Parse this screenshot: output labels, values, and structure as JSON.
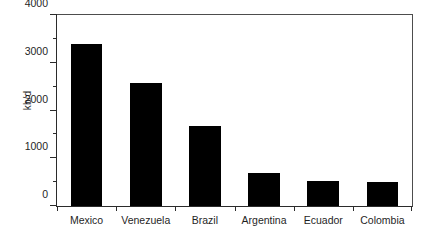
{
  "chart_data": {
    "type": "bar",
    "title": "",
    "subtitle": "",
    "xlabel": "",
    "ylabel": "kb/d",
    "categories": [
      "Mexico",
      "Venezuela",
      "Brazil",
      "Argentina",
      "Ecuador",
      "Colombia"
    ],
    "values": [
      3400,
      2580,
      1670,
      690,
      530,
      510
    ],
    "ylim": [
      0,
      4000
    ],
    "ytick_labels": [
      "0",
      "1000",
      "2000",
      "3000",
      "4000"
    ],
    "ytick_values": [
      0,
      1000,
      2000,
      3000,
      4000
    ],
    "yminor_values": [
      500,
      1500,
      2500,
      3500
    ],
    "grid": false,
    "legend": false,
    "legend_position": "none",
    "bar_color": "#000000",
    "axis_color": "#2b2b2b",
    "background_color": "#ffffff"
  }
}
